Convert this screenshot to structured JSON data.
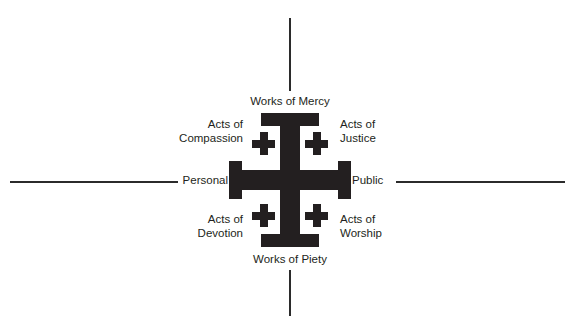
{
  "diagram": {
    "colors": {
      "cross": "#231f20",
      "axis": "#2b2b2b",
      "text": "#231f20",
      "background": "#ffffff"
    },
    "axes": {
      "vertical_top_label": "Works of Mercy",
      "vertical_bottom_label": "Works of Piety",
      "horizontal_left_label": "Personal",
      "horizontal_right_label": "Public"
    },
    "quadrants": [
      {
        "position": "top-left",
        "label": "Acts of\nCompassion"
      },
      {
        "position": "top-right",
        "label": "Acts of\nJustice"
      },
      {
        "position": "bottom-left",
        "label": "Acts of\nDevotion"
      },
      {
        "position": "bottom-right",
        "label": "Acts of\nWorship"
      }
    ],
    "center_symbol": "jerusalem-cross"
  }
}
